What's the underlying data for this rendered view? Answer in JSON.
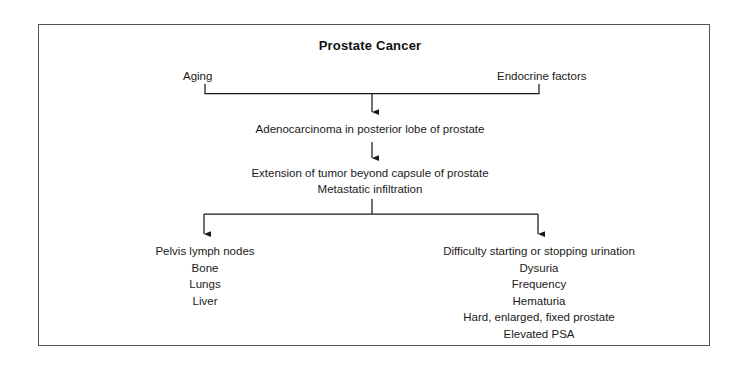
{
  "diagram": {
    "title": "Prostate Cancer",
    "type": "pathophysiology-flowchart",
    "frame_color": "#55555c",
    "text_color": "#1a1a1a",
    "background": "#ffffff",
    "causes": {
      "left": "Aging",
      "right": "Endocrine factors"
    },
    "stages": {
      "primary": "Adenocarcinoma in posterior lobe of prostate",
      "extension_line1": "Extension of tumor beyond capsule of prostate",
      "extension_line2": "Metastatic infiltration"
    },
    "outcomes": {
      "metastatic_sites": [
        "Pelvis lymph nodes",
        "Bone",
        "Lungs",
        "Liver"
      ],
      "clinical_findings": [
        "Difficulty starting or stopping urination",
        "Dysuria",
        "Frequency",
        "Hematuria",
        "Hard, enlarged, fixed prostate",
        "Elevated PSA"
      ]
    }
  }
}
